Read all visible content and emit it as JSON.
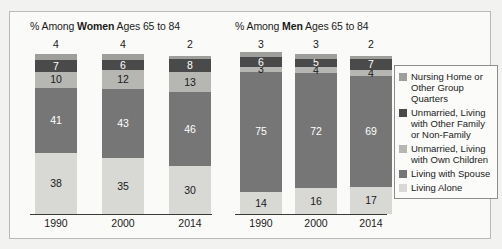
{
  "chart_data": {
    "type": "bar",
    "title": "",
    "subtitle": "",
    "xlabel": "",
    "ylabel": "",
    "ylim": [
      0,
      100
    ],
    "grid": false,
    "legend_position": "right",
    "stacked": true,
    "categories": [
      "1990",
      "2000",
      "2014"
    ],
    "panels": [
      {
        "id": "women",
        "title_prefix": "% Among ",
        "title_emphasis": "Women",
        "title_suffix": " Ages 65 to 84",
        "series": [
          {
            "name": "Living Alone",
            "color": "#d8d8d4",
            "values": [
              38,
              35,
              30
            ]
          },
          {
            "name": "Living with Spouse",
            "color": "#767676",
            "values": [
              41,
              43,
              46
            ]
          },
          {
            "name": "Unmarried, Living with Own Children",
            "color": "#b6b6b2",
            "values": [
              10,
              12,
              13
            ]
          },
          {
            "name": "Unmarried, Living with Other Family or Non-Family",
            "color": "#4a4a4a",
            "values": [
              7,
              6,
              8
            ]
          },
          {
            "name": "Nursing Home or Other Group Quarters",
            "color": "#9e9e9a",
            "values": [
              4,
              4,
              2
            ]
          }
        ]
      },
      {
        "id": "men",
        "title_prefix": "% Among ",
        "title_emphasis": "Men",
        "title_suffix": " Ages 65 to 84",
        "series": [
          {
            "name": "Living Alone",
            "color": "#d8d8d4",
            "values": [
              14,
              16,
              17
            ]
          },
          {
            "name": "Living with Spouse",
            "color": "#767676",
            "values": [
              75,
              72,
              69
            ]
          },
          {
            "name": "Unmarried, Living with Own Children",
            "color": "#b6b6b2",
            "values": [
              3,
              4,
              4
            ]
          },
          {
            "name": "Unmarried, Living with Other Family or Non-Family",
            "color": "#4a4a4a",
            "values": [
              6,
              5,
              7
            ]
          },
          {
            "name": "Nursing Home or Other Group Quarters",
            "color": "#9e9e9a",
            "values": [
              3,
              3,
              2
            ]
          }
        ]
      }
    ],
    "legend": [
      {
        "label": "Nursing Home or Other Group Quarters",
        "color": "#9e9e9a"
      },
      {
        "label": "Unmarried, Living with Other Family or Non-Family",
        "color": "#4a4a4a"
      },
      {
        "label": "Unmarried, Living with Own Children",
        "color": "#b6b6b2"
      },
      {
        "label": "Living with Spouse",
        "color": "#767676"
      },
      {
        "label": "Living Alone",
        "color": "#d8d8d4"
      }
    ]
  }
}
